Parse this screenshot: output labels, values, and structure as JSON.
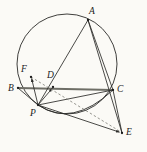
{
  "figure": {
    "background_color": "#fbfaf6",
    "stroke_color": "#2a2a28",
    "chord_color": "#6e6e66",
    "dashed_color": "#7a7a72",
    "width": 147,
    "height": 152
  },
  "points": [
    {
      "id": "A",
      "label": "A",
      "x": 88,
      "y": 20,
      "label_x": 89,
      "label_y": 7,
      "on_circle": true
    },
    {
      "id": "B",
      "label": "B",
      "x": 18,
      "y": 88,
      "label_x": 8,
      "label_y": 86,
      "on_circle": true
    },
    {
      "id": "C",
      "label": "C",
      "x": 113,
      "y": 90,
      "label_x": 117,
      "label_y": 86,
      "on_circle": true
    },
    {
      "id": "D",
      "label": "D",
      "x": 53,
      "y": 87,
      "label_x": 47,
      "label_y": 72,
      "on_circle": false
    },
    {
      "id": "E",
      "label": "E",
      "x": 122,
      "y": 133,
      "label_x": 126,
      "label_y": 129,
      "on_circle": false
    },
    {
      "id": "F",
      "label": "F",
      "x": 31,
      "y": 77,
      "label_x": 22,
      "label_y": 66,
      "on_circle": false
    },
    {
      "id": "P",
      "label": "P",
      "x": 38,
      "y": 105,
      "label_x": 31,
      "label_y": 110,
      "on_circle": true
    }
  ],
  "circle": {
    "name": "circumcircle",
    "cx": 67,
    "cy": 64,
    "r": 50
  },
  "arc_secondary": {
    "name": "arc-P-to-C",
    "path": "M 38 105 Q 72 128 113 90"
  },
  "segments": [
    {
      "name": "segment-B-C",
      "from": "B",
      "to": "C",
      "style": "thick-gray"
    },
    {
      "name": "segment-A-P",
      "from": "A",
      "to": "P",
      "style": "solid"
    },
    {
      "name": "segment-A-C",
      "from": "A",
      "to": "C",
      "style": "solid"
    },
    {
      "name": "segment-A-E",
      "from": "A",
      "to": "E",
      "style": "solid"
    },
    {
      "name": "segment-B-P",
      "from": "B",
      "to": "P",
      "style": "solid"
    },
    {
      "name": "segment-P-C",
      "from": "P",
      "to": "C",
      "style": "solid"
    },
    {
      "name": "segment-P-F",
      "from": "P",
      "to": "F",
      "style": "solid-arrow"
    },
    {
      "name": "segment-P-D",
      "from": "P",
      "to": "D",
      "style": "solid-arrow"
    },
    {
      "name": "segment-P-E",
      "from": "P",
      "to": "E",
      "style": "solid-arrow"
    },
    {
      "name": "segment-C-E",
      "from": "C",
      "to": "E",
      "style": "solid"
    },
    {
      "name": "segment-F-E-dashed",
      "from": "F",
      "to": "E",
      "style": "dashed"
    }
  ],
  "labels": {
    "A": "A",
    "B": "B",
    "C": "C",
    "D": "D",
    "E": "E",
    "F": "F",
    "P": "P"
  }
}
